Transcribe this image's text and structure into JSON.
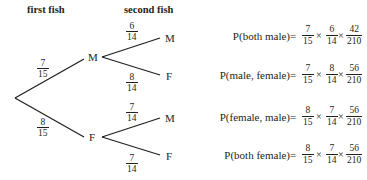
{
  "headers": {
    "first": "first fish",
    "second": "second fish"
  },
  "tree": {
    "first_level": [
      {
        "label": "M",
        "prob": {
          "num": "7",
          "den": "15"
        }
      },
      {
        "label": "F",
        "prob": {
          "num": "8",
          "den": "15"
        }
      }
    ],
    "second_level": [
      {
        "parent": "M",
        "label": "M",
        "prob": {
          "num": "6",
          "den": "14"
        }
      },
      {
        "parent": "M",
        "label": "F",
        "prob": {
          "num": "8",
          "den": "14"
        }
      },
      {
        "parent": "F",
        "label": "M",
        "prob": {
          "num": "7",
          "den": "14"
        }
      },
      {
        "parent": "F",
        "label": "F",
        "prob": {
          "num": "7",
          "den": "14"
        }
      }
    ]
  },
  "equations": [
    {
      "lhs": "P(both male)",
      "eq": "=",
      "f1": {
        "num": "7",
        "den": "15"
      },
      "op1": "×",
      "f2": {
        "num": "6",
        "den": "14"
      },
      "op2": "×",
      "f3": {
        "num": "42",
        "den": "210"
      }
    },
    {
      "lhs": "P(male, female)",
      "eq": "=",
      "f1": {
        "num": "7",
        "den": "15"
      },
      "op1": "×",
      "f2": {
        "num": "8",
        "den": "14"
      },
      "op2": "×",
      "f3": {
        "num": "56",
        "den": "210"
      }
    },
    {
      "lhs": "P(female, male)",
      "eq": "=",
      "f1": {
        "num": "8",
        "den": "15"
      },
      "op1": "×",
      "f2": {
        "num": "7",
        "den": "14"
      },
      "op2": "×",
      "f3": {
        "num": "56",
        "den": "210"
      }
    },
    {
      "lhs": "P(both female)",
      "eq": "=",
      "f1": {
        "num": "8",
        "den": "15"
      },
      "op1": "×",
      "f2": {
        "num": "7",
        "den": "14"
      },
      "op2": "×",
      "f3": {
        "num": "56",
        "den": "210"
      }
    }
  ]
}
